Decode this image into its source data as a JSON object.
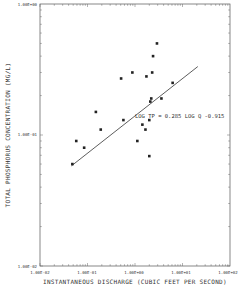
{
  "chart_data": {
    "type": "scatter",
    "title": "",
    "xlabel": "INSTANTANEOUS DISCHARGE (CUBIC FEET PER SECOND)",
    "ylabel": "TOTAL PHOSPHORUS CONCENTRATION (MG/L)",
    "xscale": "log",
    "yscale": "log",
    "xlim": [
      0.01,
      100
    ],
    "ylim": [
      0.01,
      1
    ],
    "x_tick_labels": [
      "1.00E-02",
      "1.00E-01",
      "1.00E+00",
      "1.00E+01",
      "1.00E+02"
    ],
    "y_tick_labels": [
      "1.00E-02",
      "1.00E-01",
      "1.00E+00"
    ],
    "grid": false,
    "legend": null,
    "series": [
      {
        "name": "Observations",
        "marker": "square",
        "x": [
          0.048,
          0.058,
          0.085,
          0.15,
          0.19,
          0.51,
          0.57,
          0.88,
          1.12,
          1.43,
          1.66,
          1.74,
          2.0,
          2.0,
          2.1,
          2.2,
          2.3,
          2.4,
          2.9,
          3.6,
          6.2
        ],
        "y": [
          0.06,
          0.09,
          0.08,
          0.15,
          0.11,
          0.27,
          0.13,
          0.3,
          0.09,
          0.12,
          0.11,
          0.28,
          0.13,
          0.069,
          0.18,
          0.19,
          0.3,
          0.4,
          0.5,
          0.19,
          0.25
        ]
      },
      {
        "name": "Regression line",
        "type": "line",
        "x": [
          0.046,
          100
        ],
        "y": [
          0.052,
          0.37
        ]
      }
    ],
    "annotations": [
      {
        "text": "LOG TP = 0.285 LOG Q  -0.915",
        "x": 1.0,
        "y": 0.16
      }
    ]
  },
  "labels": {
    "xlabel": "INSTANTANEOUS DISCHARGE (CUBIC FEET PER SECOND)",
    "ylabel": "TOTAL PHOSPHORUS CONCENTRATION (MG/L)",
    "equation": "LOG TP = 0.285 LOG Q  -0.915",
    "x_ticks": [
      "1.00E-02",
      "1.00E-01",
      "1.00E+00",
      "1.00E+01",
      "1.00E+02"
    ],
    "y_ticks": [
      "1.00E-02",
      "1.00E-01",
      "1.00E+00"
    ]
  }
}
